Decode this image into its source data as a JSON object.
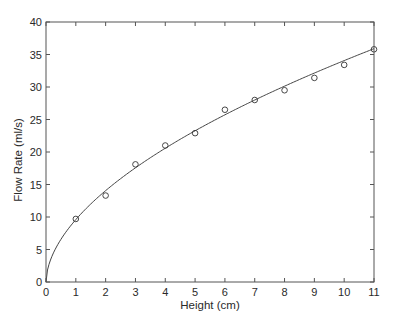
{
  "chart_data": {
    "type": "scatter",
    "title": "",
    "xlabel": "Height (cm)",
    "ylabel": "Flow Rate (ml/s)",
    "xlim": [
      0,
      11
    ],
    "ylim": [
      0,
      40
    ],
    "xticks": [
      0,
      1,
      2,
      3,
      4,
      5,
      6,
      7,
      8,
      9,
      10,
      11
    ],
    "yticks": [
      0,
      5,
      10,
      15,
      20,
      25,
      30,
      35,
      40
    ],
    "grid": false,
    "legend": null,
    "series": [
      {
        "name": "measured",
        "style": "open-circle-markers",
        "x": [
          1,
          2,
          3,
          4,
          5,
          6,
          7,
          8,
          9,
          10,
          11
        ],
        "y": [
          9.7,
          13.3,
          18.1,
          21.0,
          22.9,
          26.5,
          28.0,
          29.5,
          31.4,
          33.4,
          35.8
        ]
      },
      {
        "name": "fit",
        "style": "solid-line",
        "model": "y = a * x^b",
        "a": 9.6,
        "b": 0.55
      }
    ]
  },
  "layout": {
    "plot_left": 46,
    "plot_right": 374,
    "plot_top": 22,
    "plot_bottom": 282
  }
}
